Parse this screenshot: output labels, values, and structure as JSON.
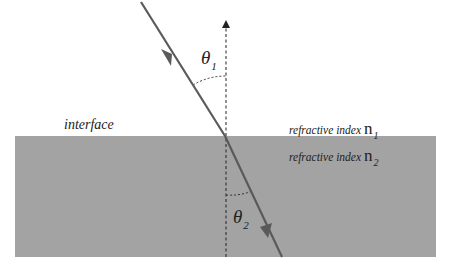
{
  "diagram": {
    "type": "refraction",
    "labels": {
      "interface": "interface",
      "medium1": {
        "text": "refractive  index",
        "symbol": "n",
        "subscript": "1"
      },
      "medium2": {
        "text": "refractive  index",
        "symbol": "n",
        "subscript": "2"
      },
      "theta1": {
        "symbol": "θ",
        "subscript": "1"
      },
      "theta2": {
        "symbol": "θ",
        "subscript": "2"
      }
    },
    "colors": {
      "medium2_fill": "#a3a3a3",
      "ray": "#5a5a5a",
      "normal": "#222222",
      "arc": "#333333",
      "background": "#ffffff"
    },
    "geometry": {
      "interface_y": 136,
      "medium2_box": {
        "x": 15,
        "y": 136,
        "width": 421,
        "height": 121
      },
      "normal_x": 226,
      "incident_ray": {
        "from": [
          141,
          2
        ],
        "to": [
          225,
          136
        ]
      },
      "refracted_ray": {
        "from": [
          225,
          136
        ],
        "to": [
          282,
          257
        ]
      }
    }
  }
}
